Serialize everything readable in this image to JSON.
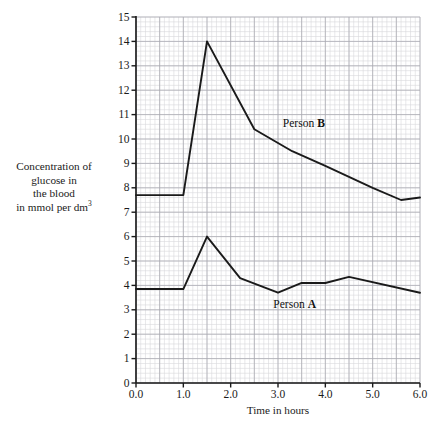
{
  "chart_data": {
    "type": "line",
    "title": "",
    "xlabel": "Time in hours",
    "ylabel": "Concentration of glucose in the blood in mmol per dm3",
    "ylabel_lines": [
      "Concentration of",
      "glucose in",
      "the blood",
      "in mmol per dm"
    ],
    "ylabel_superscript": "3",
    "xlim": [
      0.0,
      6.0
    ],
    "ylim": [
      0,
      15
    ],
    "xticks": [
      "0.0",
      "1.0",
      "2.0",
      "3.0",
      "4.0",
      "5.0",
      "6.0"
    ],
    "xtick_values": [
      0.0,
      1.0,
      2.0,
      3.0,
      4.0,
      5.0,
      6.0
    ],
    "yticks": [
      "0",
      "1",
      "2",
      "3",
      "4",
      "5",
      "6",
      "7",
      "8",
      "9",
      "10",
      "11",
      "12",
      "13",
      "14",
      "15"
    ],
    "ytick_values": [
      0,
      1,
      2,
      3,
      4,
      5,
      6,
      7,
      8,
      9,
      10,
      11,
      12,
      13,
      14,
      15
    ],
    "grid": true,
    "grid_minor_step_x": 0.1,
    "grid_minor_step_y": 0.2,
    "grid_major_step_x": 0.5,
    "grid_major_step_y": 1,
    "legend_position": "inline-annotation",
    "series": [
      {
        "name": "Person B",
        "label_text": "Person ",
        "label_bold": "B",
        "color": "#1a1a1a",
        "x": [
          0.0,
          1.0,
          1.5,
          2.5,
          3.3,
          4.0,
          5.0,
          5.6,
          6.0
        ],
        "values": [
          7.7,
          7.7,
          14.0,
          10.4,
          9.5,
          8.9,
          8.0,
          7.5,
          7.6
        ]
      },
      {
        "name": "Person A",
        "label_text": "Person ",
        "label_bold": "A",
        "color": "#1a1a1a",
        "x": [
          0.0,
          1.0,
          1.5,
          2.2,
          3.0,
          3.5,
          4.0,
          4.5,
          6.0
        ],
        "values": [
          3.85,
          3.85,
          6.0,
          4.3,
          3.7,
          4.1,
          4.1,
          4.35,
          3.7
        ]
      }
    ],
    "annotations": [
      {
        "text": "Person B",
        "x": 3.1,
        "y": 10.6
      },
      {
        "text": "Person A",
        "x": 2.9,
        "y": 3.2
      }
    ],
    "colors": {
      "line": "#1a1a1a",
      "axis": "#1a1a1a",
      "grid_minor": "#d8d8dc",
      "grid_major": "#a8a8b0",
      "background": "#ffffff"
    }
  }
}
